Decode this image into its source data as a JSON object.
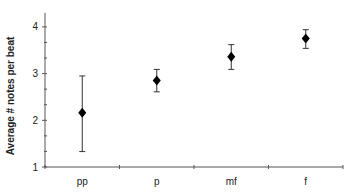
{
  "chart_data": {
    "type": "scatter",
    "subtype": "errorbar",
    "title": "",
    "xlabel": "",
    "ylabel": "Average # notes per beat",
    "categories": [
      "pp",
      "p",
      "mf",
      "f"
    ],
    "series": [
      {
        "name": "Average # notes per beat",
        "marker": "diamond",
        "color": "#000000",
        "values": [
          2.16,
          2.85,
          3.36,
          3.75
        ],
        "error_low": [
          1.33,
          2.61,
          3.09,
          3.54
        ],
        "error_high": [
          2.95,
          3.09,
          3.62,
          3.94
        ]
      }
    ],
    "ylim": [
      1,
      4.3
    ],
    "yticks": [
      1,
      2,
      3,
      4
    ],
    "ytick_labels": [
      "1",
      "2",
      "3",
      "4"
    ],
    "minor_yticks_per_unit": 3,
    "grid": false,
    "legend": null
  }
}
